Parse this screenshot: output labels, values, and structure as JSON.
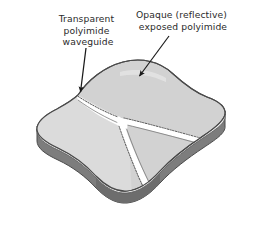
{
  "figure": {
    "background_color": "#ffffff"
  },
  "annotations": [
    {
      "id": "transparent-waveguide",
      "lines": [
        "Transparent",
        "polyimide",
        "waveguide"
      ],
      "text_anchor_x": 88,
      "text_top_y": 22,
      "line_height": 11.5,
      "arrow": {
        "from_x": 86,
        "from_y": 46,
        "to_x": 80,
        "to_y": 95
      }
    },
    {
      "id": "opaque-exposed-polyimide",
      "lines": [
        "Opaque (reflective)",
        "exposed polyimide"
      ],
      "text_anchor_x": 183,
      "text_top_y": 18,
      "line_height": 11.5,
      "arrow": {
        "from_x": 168,
        "from_y": 39,
        "to_x": 137,
        "to_y": 79
      }
    }
  ],
  "colors": {
    "slab_top_right": "#d2d2d2",
    "slab_top_left": "#d9d9d9",
    "slab_rim_light": "#e8e8e8",
    "slab_side_dark": "#7d7d7d",
    "slab_side_darker": "#6a6a6a",
    "waveguide_fill": "#ffffff",
    "outline": "#4a4a4a",
    "dotted_edge": "#555555",
    "text": "#2b2b2b",
    "arrow": "#1a1a1a"
  },
  "shape": {
    "description": "isometric pillow-shaped slab with concave left and right sides",
    "thickness_px": 13
  },
  "waveguide": {
    "description": "Y-branch channel: single input at upper-left edge splitting into two outputs (right edge and bottom)",
    "branch_count": 2,
    "junction_x": 123,
    "junction_y": 120
  }
}
